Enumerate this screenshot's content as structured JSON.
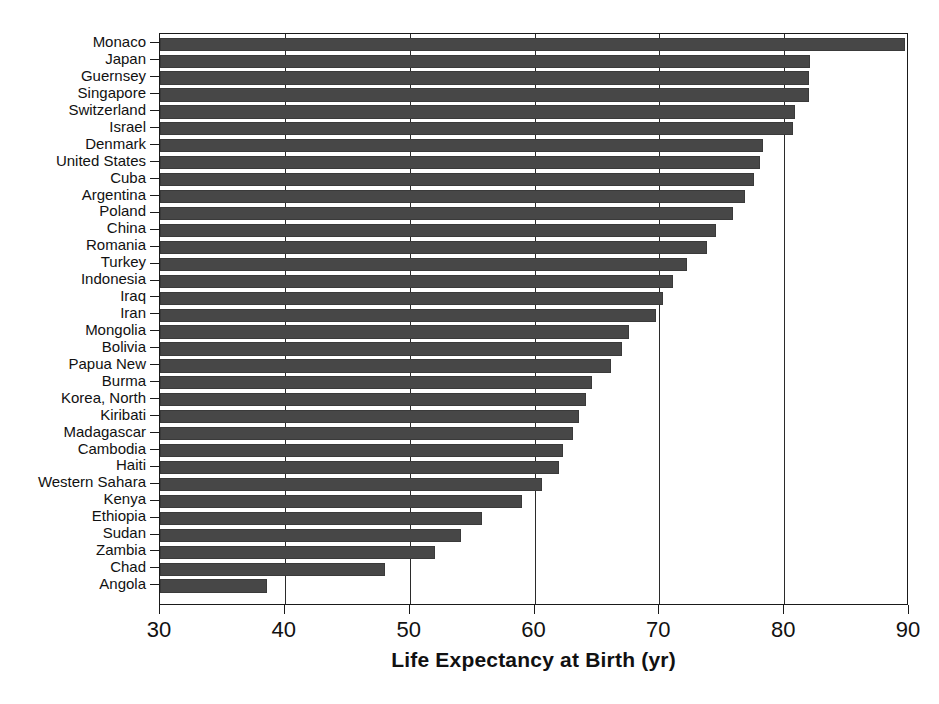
{
  "chart_data": {
    "type": "bar",
    "orientation": "horizontal",
    "title": "",
    "xlabel": "Life Expectancy at Birth (yr)",
    "ylabel": "",
    "xlim": [
      30,
      90
    ],
    "xticks": [
      30,
      40,
      50,
      60,
      70,
      80,
      90
    ],
    "grid": "vertical",
    "legend": "none",
    "bar_color": "#474747",
    "categories": [
      "Monaco",
      "Japan",
      "Guernsey",
      "Singapore",
      "Switzerland",
      "Israel",
      "Denmark",
      "United States",
      "Cuba",
      "Argentina",
      "Poland",
      "China",
      "Romania",
      "Turkey",
      "Indonesia",
      "Iraq",
      "Iran",
      "Mongolia",
      "Bolivia",
      "Papua New",
      "Burma",
      "Korea, North",
      "Kiribati",
      "Madagascar",
      "Cambodia",
      "Haiti",
      "Western Sahara",
      "Kenya",
      "Ethiopia",
      "Sudan",
      "Zambia",
      "Chad",
      "Angola"
    ],
    "values": [
      89.7,
      82.1,
      82.0,
      82.0,
      80.9,
      80.7,
      78.3,
      78.1,
      77.6,
      76.9,
      75.9,
      74.5,
      73.8,
      72.2,
      71.1,
      70.3,
      69.7,
      67.6,
      67.0,
      66.1,
      64.6,
      64.1,
      63.6,
      63.1,
      62.3,
      62.0,
      60.6,
      59.0,
      55.8,
      54.1,
      52.0,
      48.0,
      38.6
    ]
  },
  "caption": {
    "text": ""
  }
}
